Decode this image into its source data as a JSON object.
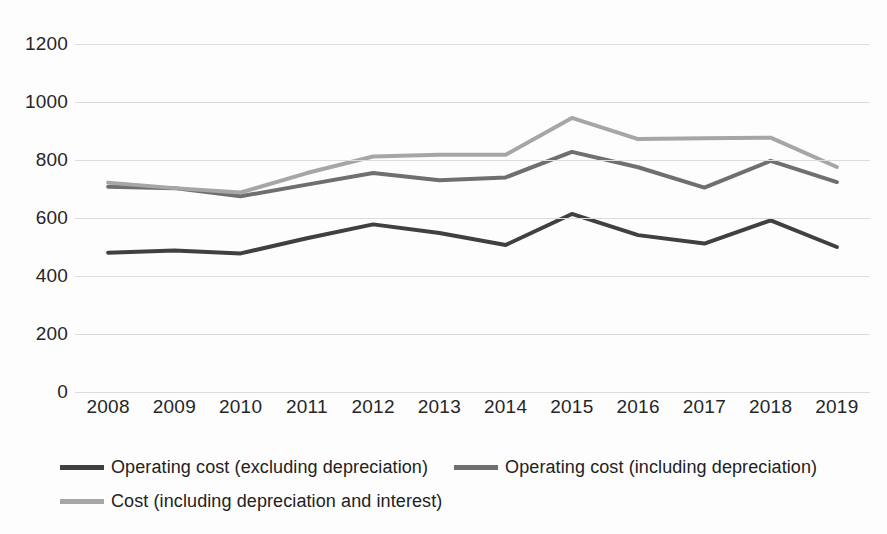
{
  "chart_data": {
    "type": "line",
    "title": "",
    "subtitle": "",
    "xlabel": "",
    "ylabel": "",
    "categories": [
      "2008",
      "2009",
      "2010",
      "2011",
      "2012",
      "2013",
      "2014",
      "2015",
      "2016",
      "2017",
      "2018",
      "2019"
    ],
    "ylim": [
      0,
      1200
    ],
    "y_ticks": [
      0,
      200,
      400,
      600,
      800,
      1000,
      1200
    ],
    "grid": "horizontal",
    "legend_position": "bottom",
    "series": [
      {
        "name": "Operating cost (excluding depreciation)",
        "color": "#404040",
        "values": [
          480,
          488,
          478,
          530,
          578,
          548,
          507,
          614,
          541,
          512,
          592,
          500
        ]
      },
      {
        "name": "Operating cost (including depreciation)",
        "color": "#6f6f6f",
        "values": [
          708,
          703,
          675,
          715,
          755,
          730,
          740,
          828,
          775,
          705,
          797,
          724
        ]
      },
      {
        "name": "Cost (including depreciation and interest)",
        "color": "#a6a6a6",
        "values": [
          722,
          703,
          688,
          755,
          812,
          818,
          818,
          945,
          872,
          875,
          877,
          776
        ]
      }
    ]
  },
  "y_tick_labels": [
    "1200",
    "1000",
    "800",
    "600",
    "400",
    "200",
    "0"
  ],
  "legend": {
    "items": [
      {
        "label": "Operating cost (excluding depreciation)",
        "color": "#404040"
      },
      {
        "label": "Operating cost (including depreciation)",
        "color": "#6f6f6f"
      },
      {
        "label": "Cost (including depreciation and interest)",
        "color": "#a6a6a6"
      }
    ]
  },
  "colors": {
    "background": "#fdfdfd",
    "gridline": "#dcdcdc",
    "text": "#262626"
  }
}
